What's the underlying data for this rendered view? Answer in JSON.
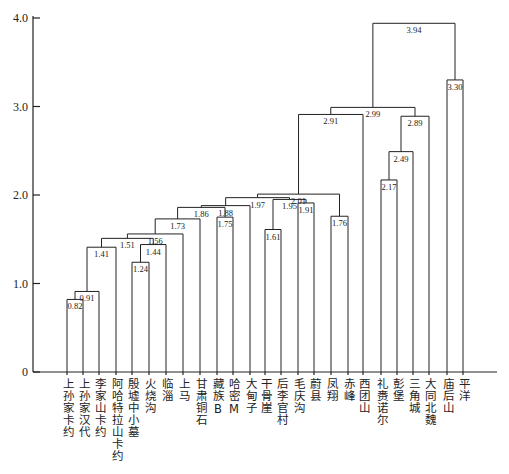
{
  "chart_data": {
    "type": "dendrogram",
    "title": "",
    "xlabel": "",
    "ylabel": "",
    "ylim": [
      0,
      4.0
    ],
    "yticks": [
      0,
      1.0,
      2.0,
      3.0,
      4.0
    ],
    "ytick_labels": [
      "0",
      "1.0",
      "2.0",
      "3.0",
      "4.0"
    ],
    "leaves": [
      "上孙家卡约",
      "上孙家汉代",
      "李家山卡约",
      "阿哈特拉山卡约",
      "殷墟中小墓",
      "火烧沟",
      "临淄",
      "上马",
      "甘肃铜石",
      "藏族B",
      "哈密M",
      "大甸子",
      "干骨崖",
      "后李官村",
      "毛庆沟",
      "蔚县",
      "凤翔",
      "赤峰",
      "西团山",
      "礼赉诺尔",
      "彭堡",
      "三角城",
      "大同北魏",
      "庙后山",
      "平洋"
    ],
    "merges": [
      {
        "id": "c1",
        "height": 0.82,
        "label": "0.82",
        "left": "L0",
        "right": "L1"
      },
      {
        "id": "c2",
        "height": 0.91,
        "label": "0.91",
        "left": "c1",
        "right": "L2"
      },
      {
        "id": "c3",
        "height": 1.41,
        "label": "1.41",
        "left": "c2",
        "right": "L3"
      },
      {
        "id": "c4",
        "height": 1.24,
        "label": "1.24",
        "left": "L4",
        "right": "L5"
      },
      {
        "id": "c5",
        "height": 1.44,
        "label": "1.44",
        "left": "c4",
        "right": "L6"
      },
      {
        "id": "c6",
        "height": 1.51,
        "label": "1.51",
        "left": "c3",
        "right": "c5"
      },
      {
        "id": "c7",
        "height": 1.56,
        "label": "1.56",
        "left": "c6",
        "right": "L7"
      },
      {
        "id": "c8",
        "height": 1.73,
        "label": "1.73",
        "left": "c7",
        "right": "L8"
      },
      {
        "id": "c9",
        "height": 1.75,
        "label": "1.75",
        "left": "L9",
        "right": "L10"
      },
      {
        "id": "c10",
        "height": 1.86,
        "label": "1.86",
        "left": "c8",
        "right": "c9"
      },
      {
        "id": "c11",
        "height": 1.88,
        "label": "1.88",
        "left": "c10",
        "right": "L11"
      },
      {
        "id": "c12",
        "height": 1.61,
        "label": "1.61",
        "left": "L12",
        "right": "L13"
      },
      {
        "id": "c13",
        "height": 1.91,
        "label": "1.91",
        "left": "L14",
        "right": "L15"
      },
      {
        "id": "c14",
        "height": 1.95,
        "label": "1.95",
        "left": "c12",
        "right": "c13"
      },
      {
        "id": "c15",
        "height": 1.97,
        "label": "1.97",
        "left": "c11",
        "right": "c14"
      },
      {
        "id": "c16",
        "height": 1.76,
        "label": "1.76",
        "left": "L16",
        "right": "L17"
      },
      {
        "id": "c17",
        "height": 2.01,
        "label": "2.01",
        "left": "c15",
        "right": "c16"
      },
      {
        "id": "c18",
        "height": 2.91,
        "label": "2.91",
        "left": "c17",
        "right": "L18"
      },
      {
        "id": "c19",
        "height": 2.17,
        "label": "2.17",
        "left": "L19",
        "right": "L20"
      },
      {
        "id": "c20",
        "height": 2.49,
        "label": "2.49",
        "left": "c19",
        "right": "L21"
      },
      {
        "id": "c21",
        "height": 2.89,
        "label": "2.89",
        "left": "c20",
        "right": "L22"
      },
      {
        "id": "c22",
        "height": 2.99,
        "label": "2.99",
        "left": "c18",
        "right": "c21"
      },
      {
        "id": "c23",
        "height": 3.3,
        "label": "3.30",
        "left": "L23",
        "right": "L24"
      },
      {
        "id": "c24",
        "height": 3.94,
        "label": "3.94",
        "left": "c22",
        "right": "c23"
      }
    ],
    "grid": false,
    "legend": null
  },
  "layout_hints": {
    "leaf_x": [
      67,
      83,
      99,
      116,
      132,
      149,
      166,
      183,
      200,
      217,
      233,
      250,
      265,
      281,
      298,
      314,
      331,
      348,
      363,
      381,
      397,
      413,
      429,
      447,
      463
    ],
    "axis_x": 33,
    "axis_bottom_y": 372,
    "axis_right_x": 497,
    "px_per_unit": 88.5
  }
}
